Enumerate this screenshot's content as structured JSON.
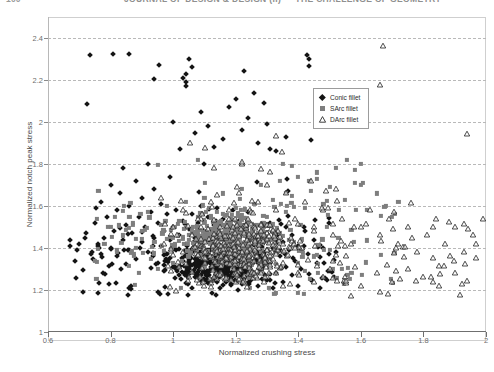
{
  "running_head": {
    "folio": "100",
    "title": "JOURNAL OF DESIGN & DESIGN (II)  —  THE CHALLENGE OF GEOMETRY"
  },
  "figure": {
    "xaxis": {
      "title": "Normalized crushing stress",
      "min": 0.6,
      "max": 2.0,
      "ticks": [
        0.6,
        0.8,
        1.0,
        1.2,
        1.4,
        1.6,
        1.8,
        2.0
      ],
      "tick_labels": [
        "0.6",
        "0.8",
        "1",
        "1.2",
        "1.4",
        "1.6",
        "1.8",
        "2"
      ]
    },
    "yaxis": {
      "title": "Normalized notch peak stress",
      "min": 1.0,
      "max": 2.5,
      "ticks": [
        1.0,
        1.2,
        1.4,
        1.6,
        1.8,
        2.0,
        2.2,
        2.4
      ],
      "tick_labels": [
        "1",
        "1.2",
        "1.4",
        "1.6",
        "1.8",
        "2",
        "2.2",
        "2.4"
      ],
      "gridlines": [
        1.2,
        1.4,
        1.6,
        1.8,
        2.0,
        2.2,
        2.4
      ]
    },
    "legend": {
      "position": "upper-right-inset",
      "entries": [
        {
          "label": "Conic fillet",
          "marker": "diamond-filled",
          "color": "#141414"
        },
        {
          "label": "SArc fillet",
          "marker": "square-filled",
          "color": "#7e7e7e"
        },
        {
          "label": "DArc fillet",
          "marker": "triangle-open",
          "color": "#2b2b2b"
        }
      ]
    }
  },
  "chart_data": {
    "type": "scatter",
    "title": "",
    "xlabel": "Normalized crushing stress",
    "ylabel": "Normalized notch peak stress",
    "xlim": [
      0.6,
      2.0
    ],
    "ylim": [
      1.0,
      2.5
    ],
    "grid": true,
    "grid_axis": "y",
    "legend_position": "upper-right-inset",
    "series": [
      {
        "name": "Conic fillet",
        "marker": "diamond-filled",
        "color": "#141414",
        "n_points": 620,
        "x_range": [
          0.67,
          1.52
        ],
        "y_range": [
          1.17,
          2.4
        ],
        "density_core": {
          "x": [
            0.95,
            1.35
          ],
          "y": [
            1.2,
            1.45
          ]
        },
        "points": [
          [
            0.67,
            1.44
          ],
          [
            0.7,
            1.42
          ],
          [
            0.72,
            1.47
          ],
          [
            0.74,
            1.38
          ],
          [
            0.75,
            1.52
          ],
          [
            0.76,
            1.41
          ],
          [
            0.77,
            1.62
          ],
          [
            0.78,
            1.45
          ],
          [
            0.79,
            1.55
          ],
          [
            0.8,
            1.4
          ],
          [
            0.8,
            1.7
          ],
          [
            0.81,
            1.48
          ],
          [
            0.82,
            1.58
          ],
          [
            0.82,
            1.36
          ],
          [
            0.83,
            1.66
          ],
          [
            0.84,
            1.44
          ],
          [
            0.84,
            1.78
          ],
          [
            0.85,
            1.51
          ],
          [
            0.86,
            1.39
          ],
          [
            0.86,
            1.6
          ],
          [
            0.87,
            1.47
          ],
          [
            0.88,
            1.72
          ],
          [
            0.88,
            1.35
          ],
          [
            0.89,
            1.55
          ],
          [
            0.9,
            1.43
          ],
          [
            0.9,
            1.64
          ],
          [
            0.91,
            1.5
          ],
          [
            0.92,
            1.38
          ],
          [
            0.92,
            1.8
          ],
          [
            0.93,
            1.57
          ],
          [
            0.94,
            1.45
          ],
          [
            0.94,
            1.68
          ],
          [
            0.95,
            1.33
          ],
          [
            0.95,
            1.52
          ],
          [
            0.96,
            1.41
          ],
          [
            0.96,
            1.61
          ],
          [
            0.97,
            1.48
          ],
          [
            0.97,
            1.29
          ],
          [
            0.98,
            1.56
          ],
          [
            0.98,
            1.37
          ],
          [
            0.99,
            1.44
          ],
          [
            0.99,
            1.74
          ],
          [
            1.0,
            1.31
          ],
          [
            1.0,
            1.5
          ],
          [
            1.0,
            2.0
          ],
          [
            1.01,
            1.39
          ],
          [
            1.01,
            1.58
          ],
          [
            1.02,
            1.27
          ],
          [
            1.02,
            1.46
          ],
          [
            1.03,
            1.34
          ],
          [
            1.03,
            1.53
          ],
          [
            1.04,
            1.42
          ],
          [
            1.04,
            2.19
          ],
          [
            1.04,
            2.23
          ],
          [
            1.05,
            1.3
          ],
          [
            1.05,
            1.49
          ],
          [
            1.05,
            2.3
          ],
          [
            1.06,
            1.38
          ],
          [
            1.06,
            1.56
          ],
          [
            1.07,
            1.26
          ],
          [
            1.07,
            1.45
          ],
          [
            1.08,
            1.33
          ],
          [
            1.08,
            1.52
          ],
          [
            1.09,
            1.41
          ],
          [
            1.09,
            1.6
          ],
          [
            1.1,
            1.29
          ],
          [
            1.1,
            1.48
          ],
          [
            1.1,
            1.8
          ],
          [
            1.11,
            1.37
          ],
          [
            1.11,
            1.55
          ],
          [
            1.12,
            1.25
          ],
          [
            1.12,
            1.44
          ],
          [
            1.13,
            1.32
          ],
          [
            1.13,
            1.51
          ],
          [
            1.14,
            1.4
          ],
          [
            1.14,
            1.59
          ],
          [
            1.15,
            1.28
          ],
          [
            1.15,
            1.47
          ],
          [
            1.16,
            1.36
          ],
          [
            1.16,
            1.54
          ],
          [
            1.17,
            1.24
          ],
          [
            1.17,
            1.43
          ],
          [
            1.18,
            1.31
          ],
          [
            1.18,
            1.5
          ],
          [
            1.19,
            1.39
          ],
          [
            1.19,
            1.58
          ],
          [
            1.2,
            1.27
          ],
          [
            1.2,
            1.46
          ],
          [
            1.2,
            2.11
          ],
          [
            1.21,
            1.35
          ],
          [
            1.21,
            1.53
          ],
          [
            1.22,
            1.23
          ],
          [
            1.22,
            1.42
          ],
          [
            1.23,
            1.3
          ],
          [
            1.23,
            1.49
          ],
          [
            1.24,
            1.38
          ],
          [
            1.24,
            1.57
          ],
          [
            1.25,
            1.26
          ],
          [
            1.25,
            1.45
          ],
          [
            1.26,
            1.34
          ],
          [
            1.26,
            2.14
          ],
          [
            1.27,
            1.22
          ],
          [
            1.27,
            1.41
          ],
          [
            1.28,
            1.29
          ],
          [
            1.28,
            1.48
          ],
          [
            1.29,
            1.37
          ],
          [
            1.29,
            2.09
          ],
          [
            1.3,
            1.25
          ],
          [
            1.3,
            1.44
          ],
          [
            1.31,
            1.33
          ],
          [
            1.31,
            1.52
          ],
          [
            1.32,
            1.21
          ],
          [
            1.32,
            1.4
          ],
          [
            1.33,
            1.28
          ],
          [
            1.33,
            1.47
          ],
          [
            1.34,
            1.36
          ],
          [
            1.35,
            1.24
          ],
          [
            1.35,
            1.43
          ],
          [
            1.36,
            1.31
          ],
          [
            1.36,
            1.5
          ],
          [
            1.37,
            1.39
          ],
          [
            1.38,
            1.27
          ],
          [
            1.38,
            1.46
          ],
          [
            1.39,
            1.34
          ],
          [
            1.4,
            1.22
          ],
          [
            1.4,
            1.41
          ],
          [
            1.41,
            1.3
          ],
          [
            1.42,
            1.48
          ],
          [
            1.43,
            1.37
          ],
          [
            1.44,
            1.25
          ],
          [
            1.45,
            1.44
          ],
          [
            1.46,
            1.33
          ],
          [
            1.47,
            1.21
          ],
          [
            1.48,
            1.4
          ],
          [
            1.5,
            1.29
          ],
          [
            1.52,
            1.38
          ],
          [
            1.03,
            2.21
          ],
          [
            1.04,
            2.17
          ],
          [
            1.06,
            2.26
          ],
          [
            1.07,
            1.95
          ],
          [
            1.09,
            2.05
          ],
          [
            1.11,
            1.98
          ],
          [
            1.13,
            1.88
          ],
          [
            1.16,
            1.92
          ],
          [
            1.18,
            2.07
          ],
          [
            1.22,
            1.96
          ],
          [
            1.24,
            2.02
          ],
          [
            1.27,
            1.9
          ],
          [
            1.3,
            1.99
          ],
          [
            1.33,
            1.86
          ],
          [
            1.36,
            1.93
          ]
        ]
      },
      {
        "name": "SArc fillet",
        "marker": "square-filled",
        "color": "#7e7e7e",
        "n_points": 520,
        "x_range": [
          0.75,
          1.72
        ],
        "y_range": [
          1.18,
          1.82
        ],
        "density_core": {
          "x": [
            0.95,
            1.4
          ],
          "y": [
            1.3,
            1.58
          ]
        },
        "points": [
          [
            0.75,
            1.34
          ],
          [
            0.78,
            1.42
          ],
          [
            0.8,
            1.5
          ],
          [
            0.82,
            1.38
          ],
          [
            0.84,
            1.46
          ],
          [
            0.86,
            1.55
          ],
          [
            0.88,
            1.4
          ],
          [
            0.9,
            1.48
          ],
          [
            0.92,
            1.57
          ],
          [
            0.94,
            1.43
          ],
          [
            0.96,
            1.51
          ],
          [
            0.98,
            1.6
          ],
          [
            1.0,
            1.45
          ],
          [
            1.02,
            1.53
          ],
          [
            1.04,
            1.62
          ],
          [
            1.06,
            1.47
          ],
          [
            1.08,
            1.55
          ],
          [
            1.1,
            1.64
          ],
          [
            1.12,
            1.49
          ],
          [
            1.14,
            1.57
          ],
          [
            1.16,
            1.66
          ],
          [
            1.18,
            1.51
          ],
          [
            1.2,
            1.59
          ],
          [
            1.22,
            1.68
          ],
          [
            1.24,
            1.53
          ],
          [
            1.26,
            1.61
          ],
          [
            1.28,
            1.7
          ],
          [
            1.3,
            1.55
          ],
          [
            1.32,
            1.63
          ],
          [
            1.34,
            1.72
          ],
          [
            1.36,
            1.57
          ],
          [
            1.38,
            1.65
          ],
          [
            1.4,
            1.74
          ],
          [
            1.42,
            1.59
          ],
          [
            1.44,
            1.67
          ],
          [
            1.46,
            1.76
          ],
          [
            1.48,
            1.61
          ],
          [
            1.5,
            1.69
          ],
          [
            1.52,
            1.78
          ],
          [
            1.55,
            1.63
          ],
          [
            1.58,
            1.71
          ],
          [
            1.6,
            1.8
          ],
          [
            1.62,
            1.58
          ],
          [
            1.65,
            1.66
          ],
          [
            1.68,
            1.6
          ],
          [
            1.7,
            1.55
          ],
          [
            1.72,
            1.62
          ],
          [
            0.95,
            1.3
          ],
          [
            1.0,
            1.33
          ],
          [
            1.05,
            1.36
          ],
          [
            1.1,
            1.31
          ],
          [
            1.15,
            1.34
          ],
          [
            1.2,
            1.37
          ],
          [
            1.25,
            1.32
          ],
          [
            1.3,
            1.35
          ],
          [
            1.35,
            1.38
          ],
          [
            1.4,
            1.33
          ],
          [
            1.45,
            1.36
          ],
          [
            1.5,
            1.39
          ],
          [
            1.08,
            1.82
          ],
          [
            1.35,
            1.8
          ],
          [
            1.46,
            1.73
          ],
          [
            1.58,
            1.77
          ]
        ]
      },
      {
        "name": "DArc fillet",
        "marker": "triangle-open",
        "color": "#2b2b2b",
        "n_points": 480,
        "x_range": [
          0.95,
          1.99
        ],
        "y_range": [
          1.17,
          2.36
        ],
        "density_core": {
          "x": [
            1.0,
            1.45
          ],
          "y": [
            1.2,
            1.55
          ]
        },
        "points": [
          [
            1.67,
            2.36
          ],
          [
            0.97,
            1.42
          ],
          [
            1.0,
            1.5
          ],
          [
            1.03,
            1.58
          ],
          [
            1.06,
            1.46
          ],
          [
            1.09,
            1.54
          ],
          [
            1.12,
            1.62
          ],
          [
            1.15,
            1.5
          ],
          [
            1.18,
            1.58
          ],
          [
            1.21,
            1.66
          ],
          [
            1.24,
            1.54
          ],
          [
            1.27,
            1.62
          ],
          [
            1.3,
            1.7
          ],
          [
            1.33,
            1.58
          ],
          [
            1.36,
            1.66
          ],
          [
            1.39,
            1.54
          ],
          [
            1.42,
            1.62
          ],
          [
            1.45,
            1.5
          ],
          [
            1.48,
            1.58
          ],
          [
            1.51,
            1.46
          ],
          [
            1.54,
            1.54
          ],
          [
            1.57,
            1.42
          ],
          [
            1.6,
            1.5
          ],
          [
            1.63,
            1.58
          ],
          [
            1.66,
            1.46
          ],
          [
            1.69,
            1.54
          ],
          [
            1.72,
            1.42
          ],
          [
            1.75,
            1.5
          ],
          [
            1.78,
            1.38
          ],
          [
            1.81,
            1.46
          ],
          [
            1.84,
            1.54
          ],
          [
            1.87,
            1.42
          ],
          [
            1.9,
            1.5
          ],
          [
            1.93,
            1.38
          ],
          [
            1.96,
            1.46
          ],
          [
            1.99,
            1.54
          ],
          [
            1.05,
            1.26
          ],
          [
            1.1,
            1.22
          ],
          [
            1.15,
            1.28
          ],
          [
            1.2,
            1.24
          ],
          [
            1.25,
            1.3
          ],
          [
            1.3,
            1.26
          ],
          [
            1.35,
            1.22
          ],
          [
            1.4,
            1.28
          ],
          [
            1.45,
            1.24
          ],
          [
            1.5,
            1.3
          ],
          [
            1.55,
            1.26
          ],
          [
            1.6,
            1.22
          ],
          [
            1.65,
            1.28
          ],
          [
            1.7,
            1.24
          ],
          [
            1.75,
            1.3
          ],
          [
            1.8,
            1.26
          ],
          [
            1.85,
            1.22
          ],
          [
            1.9,
            1.28
          ],
          [
            1.13,
            1.78
          ],
          [
            1.22,
            1.8
          ],
          [
            1.31,
            1.76
          ],
          [
            1.44,
            1.72
          ],
          [
            1.52,
            1.68
          ]
        ]
      }
    ]
  }
}
